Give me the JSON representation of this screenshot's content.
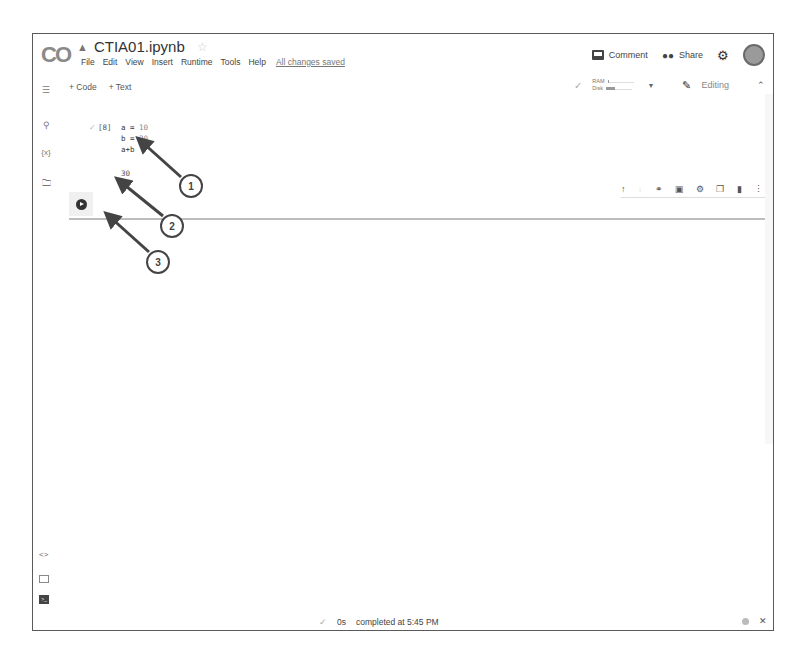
{
  "app": {
    "logo": "CO",
    "title": "CTIA01.ipynb"
  },
  "menu": {
    "items": [
      "File",
      "Edit",
      "View",
      "Insert",
      "Runtime",
      "Tools",
      "Help"
    ],
    "save_status": "All changes saved"
  },
  "header": {
    "comment_label": "Comment",
    "share_label": "Share"
  },
  "toolbar": {
    "add_code": "+ Code",
    "add_text": "+ Text"
  },
  "resources": {
    "ram_label": "RAM",
    "disk_label": "Disk",
    "ram_fill_pct": 6,
    "disk_fill_pct": 35,
    "mode_label": "Editing"
  },
  "cell": {
    "execution_count": "[8]",
    "code_lines": [
      {
        "var": "a",
        "op": " = ",
        "val": "10"
      },
      {
        "var": "b",
        "op": " = ",
        "val": "20"
      }
    ],
    "code_expr": "a+b",
    "output": "30"
  },
  "status_bar": {
    "duration": "0s",
    "message": "completed at 5:45 PM"
  },
  "annotations": [
    {
      "label": "1"
    },
    {
      "label": "2"
    },
    {
      "label": "3"
    }
  ],
  "colors": {
    "frame_border": "#5a5a5a",
    "annotation": "#444444"
  }
}
